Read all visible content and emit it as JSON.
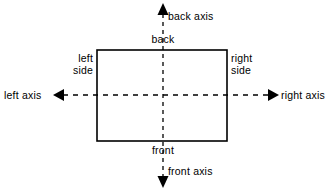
{
  "diagram": {
    "background_color": "#ffffff",
    "stroke_color": "#000000",
    "labels": {
      "back_axis": "back axis",
      "back": "back",
      "left_side": "left\nside",
      "right_side": "right\nside",
      "left_axis": "left axis",
      "right_axis": "right axis",
      "front": "front",
      "front_axis": "front axis"
    },
    "rectangle": {
      "x": 97,
      "y": 50,
      "width": 130,
      "height": 91,
      "stroke_width": 1.6,
      "fill": "none"
    },
    "center": {
      "x": 163,
      "y": 95
    },
    "axes": [
      {
        "name": "vertical-axis",
        "orientation": "vertical",
        "from": {
          "x": 163,
          "y": 14
        },
        "to": {
          "x": 163,
          "y": 177
        },
        "dash": "4 4",
        "arrow_start": "back",
        "arrow_end": "front"
      },
      {
        "name": "horizontal-axis",
        "orientation": "horizontal",
        "from": {
          "x": 63,
          "y": 95
        },
        "to": {
          "x": 270,
          "y": 95
        },
        "dash": "5 5",
        "arrow_start": "left",
        "arrow_end": "right"
      }
    ],
    "arrowheads": [
      {
        "name": "back-arrowhead",
        "direction": "up",
        "points": "163,3 157.5,15 168.5,15"
      },
      {
        "name": "front-arrowhead",
        "direction": "down",
        "points": "163,188 157.5,176 168.5,176"
      },
      {
        "name": "left-arrowhead",
        "direction": "left",
        "points": "53,95 64,89 64,101"
      },
      {
        "name": "right-arrowhead",
        "direction": "right",
        "points": "279,95 268,89 268,101"
      }
    ]
  }
}
